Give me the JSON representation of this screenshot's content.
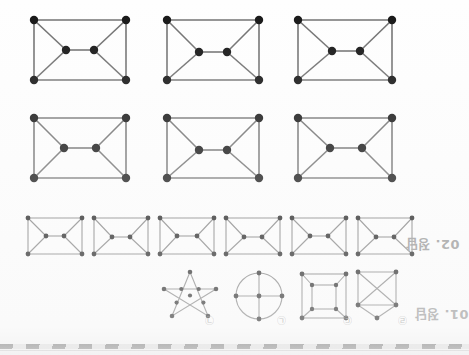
{
  "page": {
    "kind": "scanned-answer-key",
    "orientation": "upside-down-scan",
    "background_color": "#ffffff",
    "ink_color": "#1a1a1a",
    "edge_color": "#6f6f6f",
    "label_color": "#8d8d8d"
  },
  "sections": {
    "answer_02": {
      "label": "02. 정답",
      "row_count": 3,
      "note": "six-vertex bowtie-in-rectangle graphs"
    },
    "answer_01": {
      "label": "01. 정답",
      "note": "four candidate figures labelled with circled Korean letters"
    }
  },
  "row1": {
    "name": "large-graph-row-1",
    "graphs": [
      {
        "id": "g1-1",
        "type": "bowtie-in-rectangle",
        "vertices": 6,
        "edges": 9
      },
      {
        "id": "g1-2",
        "type": "bowtie-in-rectangle",
        "vertices": 6,
        "edges": 9
      },
      {
        "id": "g1-3",
        "type": "bowtie-in-rectangle",
        "vertices": 6,
        "edges": 9
      }
    ]
  },
  "row2": {
    "name": "large-graph-row-2",
    "graphs": [
      {
        "id": "g2-1",
        "type": "bowtie-in-rectangle",
        "vertices": 6,
        "edges": 9
      },
      {
        "id": "g2-2",
        "type": "bowtie-in-rectangle",
        "vertices": 6,
        "edges": 9
      },
      {
        "id": "g2-3",
        "type": "bowtie-in-rectangle",
        "vertices": 6,
        "edges": 9
      }
    ]
  },
  "row3": {
    "name": "small-graph-row",
    "graphs": [
      {
        "id": "g3-1",
        "type": "bowtie-in-rectangle",
        "vertices": 6,
        "edges": 9
      },
      {
        "id": "g3-2",
        "type": "bowtie-in-rectangle",
        "vertices": 6,
        "edges": 9
      },
      {
        "id": "g3-3",
        "type": "bowtie-in-rectangle",
        "vertices": 6,
        "edges": 9
      },
      {
        "id": "g3-4",
        "type": "bowtie-in-rectangle",
        "vertices": 6,
        "edges": 9
      },
      {
        "id": "g3-5",
        "type": "bowtie-in-rectangle",
        "vertices": 6,
        "edges": 9
      },
      {
        "id": "g3-6",
        "type": "bowtie-in-rectangle",
        "vertices": 6,
        "edges": 9
      }
    ]
  },
  "row4": {
    "name": "candidate-figure-row",
    "figures": [
      {
        "id": "f-a",
        "marker": "㉠",
        "type": "pentagram-star",
        "vertices": 10
      },
      {
        "id": "f-b",
        "marker": "㉡",
        "type": "circle-with-cross",
        "vertices": 5
      },
      {
        "id": "f-c",
        "marker": "㉢",
        "type": "cube-graph",
        "vertices": 8
      },
      {
        "id": "f-d",
        "marker": "㉣",
        "type": "k4-plus-apex",
        "vertices": 5
      }
    ]
  },
  "bottom_strip": {
    "name": "scanner-edge-strip",
    "pattern": "diagonal-hatch"
  }
}
